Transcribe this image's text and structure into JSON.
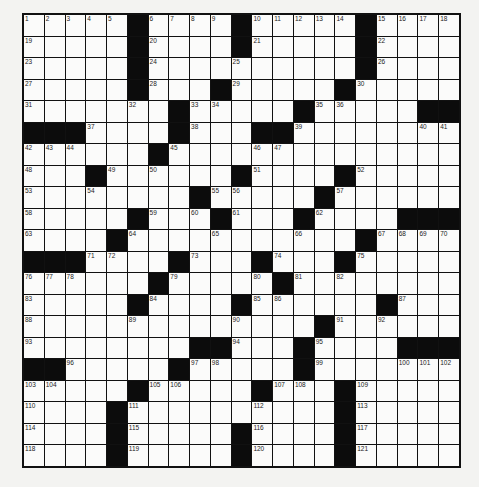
{
  "puzzle": {
    "rows": 21,
    "cols": 21,
    "grid": [
      [
        "1",
        "2",
        "3",
        "4",
        "5",
        "#",
        "6",
        "7",
        "8",
        "9",
        "#",
        "10",
        "11",
        "12",
        "13",
        "14",
        "#",
        "15",
        "16",
        "17",
        "18"
      ],
      [
        "19",
        "",
        "",
        "",
        "",
        "#",
        "20",
        "",
        "",
        "",
        "#",
        "21",
        "",
        "",
        "",
        "",
        "#",
        "22",
        "",
        "",
        ""
      ],
      [
        "23",
        "",
        "",
        "",
        "",
        "#",
        "24",
        "",
        "",
        "",
        "25",
        "",
        "",
        "",
        "",
        "",
        "#",
        "26",
        "",
        "",
        ""
      ],
      [
        "27",
        "",
        "",
        "",
        "",
        "#",
        "28",
        "",
        "",
        "#",
        "29",
        "",
        "",
        "",
        "",
        "#",
        "30",
        "",
        "",
        "",
        ""
      ],
      [
        "31",
        "",
        "",
        "",
        "",
        "32",
        "",
        "#",
        "33",
        "34",
        "",
        "",
        "",
        "#",
        "35",
        "36",
        "",
        "",
        "",
        "#",
        "#"
      ],
      [
        "#",
        "#",
        "#",
        "37",
        "",
        "",
        "",
        "#",
        "38",
        "",
        "",
        "#",
        "#",
        "39",
        "",
        "",
        "",
        "",
        "",
        "40",
        "41"
      ],
      [
        "42",
        "43",
        "44",
        "",
        "",
        "",
        "#",
        "45",
        "",
        "",
        "",
        "46",
        "47",
        "",
        "",
        "",
        "",
        "",
        "",
        "",
        ""
      ],
      [
        "48",
        "",
        "",
        "#",
        "49",
        "",
        "50",
        "",
        "",
        "",
        "#",
        "51",
        "",
        "",
        "",
        "#",
        "52",
        "",
        "",
        "",
        ""
      ],
      [
        "53",
        "",
        "",
        "54",
        "",
        "",
        "",
        "",
        "#",
        "55",
        "56",
        "",
        "",
        "",
        "#",
        "57",
        "",
        "",
        "",
        "",
        ""
      ],
      [
        "58",
        "",
        "",
        "",
        "",
        "#",
        "59",
        "",
        "60",
        "#",
        "61",
        "",
        "",
        "#",
        "62",
        "",
        "",
        "",
        "#",
        "#",
        "#"
      ],
      [
        "63",
        "",
        "",
        "",
        "#",
        "64",
        "",
        "",
        "",
        "65",
        "",
        "",
        "",
        "66",
        "",
        "",
        "#",
        "67",
        "68",
        "69",
        "70"
      ],
      [
        "#",
        "#",
        "#",
        "71",
        "72",
        "",
        "",
        "#",
        "73",
        "",
        "",
        "#",
        "74",
        "",
        "",
        "#",
        "75",
        "",
        "",
        "",
        ""
      ],
      [
        "76",
        "77",
        "78",
        "",
        "",
        "",
        "#",
        "79",
        "",
        "",
        "",
        "80",
        "#",
        "81",
        "",
        "82",
        "",
        "",
        "",
        "",
        ""
      ],
      [
        "83",
        "",
        "",
        "",
        "",
        "#",
        "84",
        "",
        "",
        "",
        "#",
        "85",
        "86",
        "",
        "",
        "",
        "",
        "#",
        "87",
        "",
        ""
      ],
      [
        "88",
        "",
        "",
        "",
        "",
        "89",
        "",
        "",
        "",
        "",
        "90",
        "",
        "",
        "",
        "#",
        "91",
        "",
        "92",
        "",
        "",
        ""
      ],
      [
        "93",
        "",
        "",
        "",
        "",
        "",
        "",
        "",
        "#",
        "#",
        "94",
        "",
        "",
        "#",
        "95",
        "",
        "",
        "",
        "#",
        "#",
        "#"
      ],
      [
        "#",
        "#",
        "96",
        "",
        "",
        "",
        "",
        "#",
        "97",
        "98",
        "",
        "",
        "",
        "#",
        "99",
        "",
        "",
        "",
        "100",
        "101",
        "102"
      ],
      [
        "103",
        "104",
        "",
        "",
        "",
        "#",
        "105",
        "106",
        "",
        "",
        "",
        "#",
        "107",
        "108",
        "",
        "#",
        "109",
        "",
        "",
        "",
        ""
      ],
      [
        "110",
        "",
        "",
        "",
        "#",
        "111",
        "",
        "",
        "",
        "",
        "",
        "112",
        "",
        "",
        "",
        "#",
        "113",
        "",
        "",
        "",
        ""
      ],
      [
        "114",
        "",
        "",
        "",
        "#",
        "115",
        "",
        "",
        "",
        "",
        "#",
        "116",
        "",
        "",
        "",
        "#",
        "117",
        "",
        "",
        "",
        ""
      ],
      [
        "118",
        "",
        "",
        "",
        "#",
        "119",
        "",
        "",
        "",
        "",
        "#",
        "120",
        "",
        "",
        "",
        "#",
        "121",
        "",
        "",
        "",
        ""
      ]
    ]
  },
  "colors": {
    "block": "#0c0c0c",
    "cell": "#fbfbfa",
    "background": "#f3f3f1"
  }
}
